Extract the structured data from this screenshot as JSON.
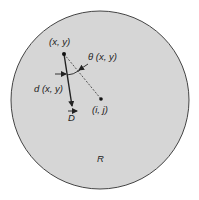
{
  "diagram": {
    "region": {
      "label": "R",
      "fill": "#d6d6d6",
      "stroke": "#444444"
    },
    "points": {
      "origin": {
        "label": "(x, y)"
      },
      "target": {
        "label": "(i, j)"
      }
    },
    "vectors": {
      "direction": {
        "label": "D"
      }
    },
    "annotations": {
      "angle": {
        "label": "θ (x, y)"
      },
      "distance": {
        "label": "d (x, y)"
      }
    }
  }
}
